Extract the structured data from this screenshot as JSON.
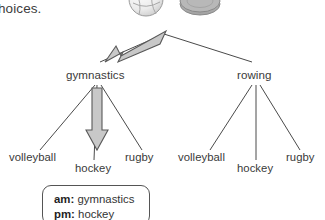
{
  "page": {
    "lead_text": "hoices.",
    "background_color": "#ffffff",
    "text_color": "#3a3a3a"
  },
  "images": [
    {
      "name": "volleyball",
      "icon": "volleyball-image",
      "fill": "#e8e8e8",
      "stroke": "#9a9a9a"
    },
    {
      "name": "hockey puck",
      "icon": "puck-image",
      "fill": "#b4b4b4",
      "stroke": "#8a8a8a"
    }
  ],
  "tree": {
    "root_label": "",
    "branches": [
      {
        "label": "gymnastics",
        "leaves": [
          {
            "label": "volleyball"
          },
          {
            "label": "hockey"
          },
          {
            "label": "rugby"
          }
        ]
      },
      {
        "label": "rowing",
        "leaves": [
          {
            "label": "volleyball"
          },
          {
            "label": "hockey"
          },
          {
            "label": "rugby"
          }
        ]
      }
    ]
  },
  "annotations": {
    "arrow_to_branch": {
      "name": "arrow-to-gymnastics",
      "fill": "#c8c8c8",
      "stroke": "#595959",
      "points_to": "gymnastics"
    },
    "arrow_to_leaf": {
      "name": "arrow-to-hockey",
      "fill": "#c8c8c8",
      "stroke": "#595959",
      "points_to": "hockey"
    }
  },
  "callout": {
    "rows": [
      {
        "key": "am:",
        "value": "gymnastics"
      },
      {
        "key": "pm:",
        "value": "hockey"
      }
    ],
    "border_color": "#555555"
  }
}
